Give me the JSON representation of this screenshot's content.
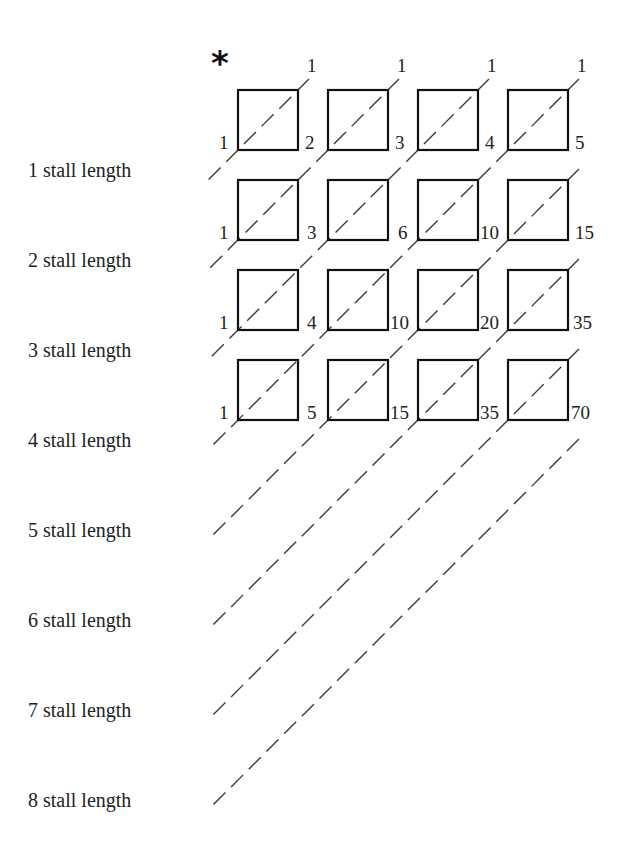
{
  "diagram": {
    "marker": "*",
    "top_labels": [
      "1",
      "1",
      "1",
      "1"
    ],
    "row_labels": [
      "1 stall length",
      "2 stall length",
      "3 stall length",
      "4 stall length",
      "5 stall length",
      "6 stall length",
      "7 stall length",
      "8 stall length"
    ],
    "grid": {
      "rows": 4,
      "cols": 4,
      "left_values": [
        "1",
        "1",
        "1",
        "1"
      ],
      "cell_values": [
        [
          "2",
          "3",
          "4",
          "5"
        ],
        [
          "3",
          "6",
          "10",
          "15"
        ],
        [
          "4",
          "10",
          "20",
          "35"
        ],
        [
          "5",
          "15",
          "35",
          "70"
        ]
      ]
    },
    "colors": {
      "box_stroke": "#111111",
      "dash_stroke": "#3a3a3a",
      "background": "#ffffff"
    }
  }
}
